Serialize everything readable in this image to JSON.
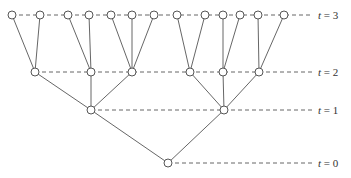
{
  "diagram": {
    "type": "tree",
    "levels": [
      {
        "label_var": "t",
        "label_eq": "= 3",
        "y": 15,
        "line_end_x": 312,
        "label_x": 318
      },
      {
        "label_var": "t",
        "label_eq": "= 2",
        "y": 72,
        "line_end_x": 312,
        "label_x": 318
      },
      {
        "label_var": "t",
        "label_eq": "= 1",
        "y": 110,
        "line_end_x": 312,
        "label_x": 318
      },
      {
        "label_var": "t",
        "label_eq": "= 0",
        "y": 163,
        "line_end_x": 312,
        "label_x": 318
      }
    ],
    "nodes": {
      "t0": [
        168
      ],
      "t1": [
        91,
        224
      ],
      "t2": [
        35,
        91,
        132,
        190,
        223,
        259
      ],
      "t3": [
        12,
        40,
        68,
        89,
        111,
        132,
        154,
        177,
        205,
        223,
        240,
        258,
        284
      ]
    },
    "edges": [
      {
        "from": [
          "t0",
          0
        ],
        "to": [
          "t1",
          0
        ]
      },
      {
        "from": [
          "t0",
          0
        ],
        "to": [
          "t1",
          1
        ]
      },
      {
        "from": [
          "t1",
          0
        ],
        "to": [
          "t2",
          0
        ]
      },
      {
        "from": [
          "t1",
          0
        ],
        "to": [
          "t2",
          1
        ]
      },
      {
        "from": [
          "t1",
          0
        ],
        "to": [
          "t2",
          2
        ]
      },
      {
        "from": [
          "t1",
          1
        ],
        "to": [
          "t2",
          3
        ]
      },
      {
        "from": [
          "t1",
          1
        ],
        "to": [
          "t2",
          4
        ]
      },
      {
        "from": [
          "t1",
          1
        ],
        "to": [
          "t2",
          5
        ]
      },
      {
        "from": [
          "t2",
          0
        ],
        "to": [
          "t3",
          0
        ]
      },
      {
        "from": [
          "t2",
          0
        ],
        "to": [
          "t3",
          1
        ]
      },
      {
        "from": [
          "t2",
          1
        ],
        "to": [
          "t3",
          2
        ]
      },
      {
        "from": [
          "t2",
          1
        ],
        "to": [
          "t3",
          3
        ]
      },
      {
        "from": [
          "t2",
          2
        ],
        "to": [
          "t3",
          4
        ]
      },
      {
        "from": [
          "t2",
          2
        ],
        "to": [
          "t3",
          5
        ]
      },
      {
        "from": [
          "t2",
          2
        ],
        "to": [
          "t3",
          6
        ]
      },
      {
        "from": [
          "t2",
          3
        ],
        "to": [
          "t3",
          7
        ]
      },
      {
        "from": [
          "t2",
          3
        ],
        "to": [
          "t3",
          8
        ]
      },
      {
        "from": [
          "t2",
          4
        ],
        "to": [
          "t3",
          9
        ]
      },
      {
        "from": [
          "t2",
          4
        ],
        "to": [
          "t3",
          10
        ]
      },
      {
        "from": [
          "t2",
          5
        ],
        "to": [
          "t3",
          11
        ]
      },
      {
        "from": [
          "t2",
          5
        ],
        "to": [
          "t3",
          12
        ]
      }
    ],
    "colors": {
      "stroke": "#555555",
      "node_fill": "#ffffff",
      "text": "#333333"
    }
  }
}
